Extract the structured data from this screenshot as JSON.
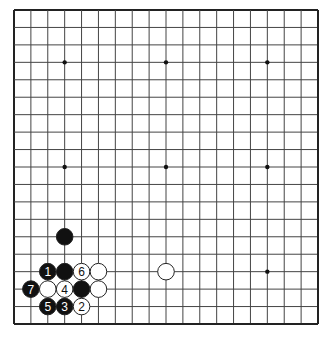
{
  "board": {
    "size": 19,
    "left": 14,
    "top": 10,
    "right": 318,
    "bottom": 324,
    "line_color": "#444444",
    "border_color": "#222222",
    "background": "#ffffff",
    "hoshi": [
      [
        3,
        3
      ],
      [
        9,
        3
      ],
      [
        15,
        3
      ],
      [
        3,
        9
      ],
      [
        9,
        9
      ],
      [
        15,
        9
      ],
      [
        3,
        15
      ],
      [
        9,
        15
      ],
      [
        15,
        15
      ]
    ]
  },
  "stones": [
    {
      "color": "black",
      "col": 3,
      "row": 13,
      "label": ""
    },
    {
      "color": "black",
      "col": 2,
      "row": 15,
      "label": "1"
    },
    {
      "color": "black",
      "col": 3,
      "row": 15,
      "label": ""
    },
    {
      "color": "white",
      "col": 4,
      "row": 15,
      "label": "6"
    },
    {
      "color": "white",
      "col": 5,
      "row": 15,
      "label": ""
    },
    {
      "color": "white",
      "col": 9,
      "row": 15,
      "label": ""
    },
    {
      "color": "black",
      "col": 1,
      "row": 16,
      "label": "7"
    },
    {
      "color": "white",
      "col": 2,
      "row": 16,
      "label": ""
    },
    {
      "color": "white",
      "col": 3,
      "row": 16,
      "label": "4"
    },
    {
      "color": "black",
      "col": 4,
      "row": 16,
      "label": ""
    },
    {
      "color": "white",
      "col": 5,
      "row": 16,
      "label": ""
    },
    {
      "color": "black",
      "col": 2,
      "row": 17,
      "label": "5"
    },
    {
      "color": "black",
      "col": 3,
      "row": 17,
      "label": "3"
    },
    {
      "color": "white",
      "col": 4,
      "row": 17,
      "label": "2"
    }
  ]
}
